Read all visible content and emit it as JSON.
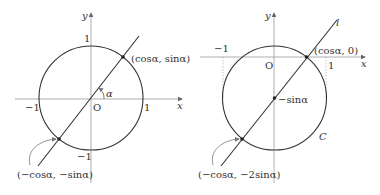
{
  "figures": [
    {
      "name": "left",
      "axis_labels": {
        "x": "x",
        "y": "y"
      },
      "origin_label": "O",
      "ticks": {
        "x_pos": "1",
        "x_neg": "−1",
        "y_pos": "1",
        "y_neg": "−1"
      },
      "angle_label": "α",
      "point_upper": "(cosα, sinα)",
      "point_lower": "(−cosα, −sinα)"
    },
    {
      "name": "right",
      "axis_labels": {
        "x": "x",
        "y": "y"
      },
      "origin_label": "O",
      "ticks": {
        "x_pos": "1",
        "x_neg": "−1"
      },
      "line_label": "l",
      "circle_label": "C",
      "center_label": "−sinα",
      "point_upper": "(cosα, 0)",
      "point_lower": "(−cosα, −2sinα)"
    }
  ],
  "colors": {
    "stroke": "#333333",
    "axis": "#888888",
    "dotted": "#999999"
  }
}
